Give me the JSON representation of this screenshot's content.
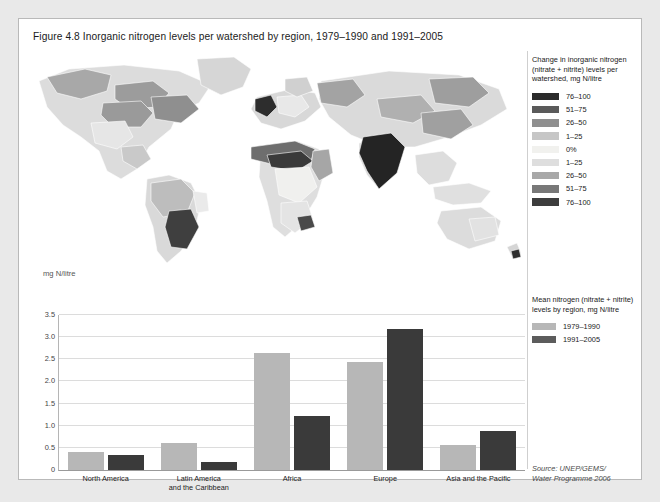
{
  "figure": {
    "title": "Figure 4.8 Inorganic nitrogen levels per watershed by region, 1979–1990 and 1991–2005"
  },
  "map_legend": {
    "title": "Change in inorganic nitrogen (nitrate + nitrite) levels per watershed, mg N/litre",
    "title_line1": "Change in inorganic nitrogen",
    "title_line2": "(nitrate + nitrite) levels per",
    "title_line3": "watershed, mg N/litre",
    "items": [
      {
        "label": "76–100",
        "color": "#2b2b2b"
      },
      {
        "label": "51–75",
        "color": "#5a5a5a"
      },
      {
        "label": "26–50",
        "color": "#8f8f8f"
      },
      {
        "label": "1–25",
        "color": "#c6c6c6"
      },
      {
        "label": "0%",
        "color": "#f1f1ee"
      },
      {
        "label": "1–25",
        "color": "#dedede"
      },
      {
        "label": "26–50",
        "color": "#a8a8a8"
      },
      {
        "label": "51–75",
        "color": "#787878"
      },
      {
        "label": "76–100",
        "color": "#3d3d3d"
      }
    ]
  },
  "chart_legend": {
    "title_line1": "Mean nitrogen (nitrate + nitrite)",
    "title_line2": "levels by region, mg N/litre",
    "items": [
      {
        "label": "1979–1990",
        "color": "#b7b7b7"
      },
      {
        "label": "1991–2005",
        "color": "#5c5c5c"
      }
    ]
  },
  "source": {
    "line1": "Source: UNEP/GEMS/",
    "line2": "Water Programme 2006"
  },
  "chart_data": {
    "type": "bar",
    "title": "Mean nitrogen (nitrate + nitrite) levels by region, mg N/litre",
    "xlabel": "",
    "ylabel": "mg N/litre",
    "ylim": [
      0,
      3.5
    ],
    "yticks": [
      "0",
      "0.5",
      "1.0",
      "1.5",
      "2.0",
      "2.5",
      "3.0",
      "3.5"
    ],
    "ytick_values": [
      0,
      0.5,
      1.0,
      1.5,
      2.0,
      2.5,
      3.0,
      3.5
    ],
    "grid": true,
    "legend_position": "right",
    "categories": [
      "North America",
      "Latin America and the Caribbean",
      "Africa",
      "Europe",
      "Asia and the Pacific"
    ],
    "category_lines": [
      [
        "North America"
      ],
      [
        "Latin America",
        "and the Caribbean"
      ],
      [
        "Africa"
      ],
      [
        "Europe"
      ],
      [
        "Asia and the Pacific"
      ]
    ],
    "series": [
      {
        "name": "1979–1990",
        "color": "#b7b7b7",
        "values": [
          0.4,
          0.6,
          2.65,
          2.45,
          0.57
        ]
      },
      {
        "name": "1991–2005",
        "color": "#3a3a3a",
        "values": [
          0.35,
          0.17,
          1.22,
          3.18,
          0.87
        ]
      }
    ]
  }
}
